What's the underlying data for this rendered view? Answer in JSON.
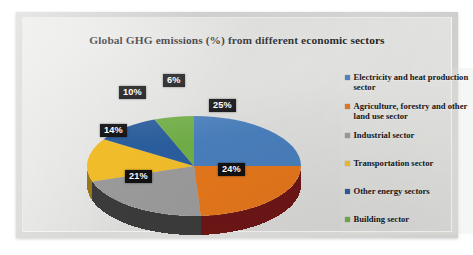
{
  "chart_data": {
    "type": "pie",
    "title": "Global GHG emissions (%) from different economic sectors",
    "xlabel": "",
    "ylabel": "",
    "legend_position": "right",
    "grid": false,
    "three_d": true,
    "categories": [
      "Electricity and heat production sector",
      "Agriculture, forestry and other land use sector",
      "Industrial sector",
      "Transportation sector",
      "Other energy sectors",
      "Building sector"
    ],
    "values": [
      25,
      24,
      21,
      14,
      10,
      6
    ],
    "data_labels": [
      "25%",
      "24%",
      "21%",
      "14%",
      "10%",
      "6%"
    ],
    "colors": [
      "#4a7ebb",
      "#e3761f",
      "#9a9a9a",
      "#f0bc2a",
      "#2c5d9c",
      "#70ad47"
    ],
    "side_colors": [
      "#2f5179",
      "#6d1616",
      "#3a3a3a",
      "#9a7714",
      "#1c3c66",
      "#49702d"
    ]
  },
  "legend": {
    "items": [
      {
        "label": "Electricity and heat production sector",
        "color": "#4a7ebb"
      },
      {
        "label": "Agriculture, forestry and other land use sector",
        "color": "#e3761f"
      },
      {
        "label": "Industrial sector",
        "color": "#9a9a9a"
      },
      {
        "label": "Transportation sector",
        "color": "#f0bc2a"
      },
      {
        "label": "Other energy sectors",
        "color": "#2c5d9c"
      },
      {
        "label": "Building sector",
        "color": "#70ad47"
      }
    ]
  }
}
